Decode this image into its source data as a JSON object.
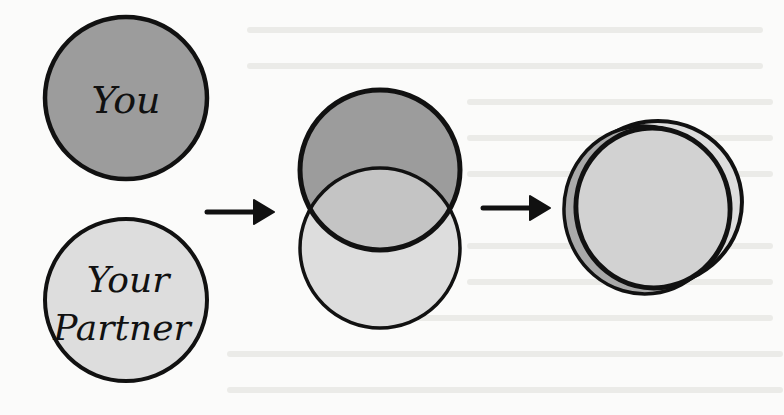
{
  "diagram": {
    "type": "relationship-merge-flow",
    "stages": [
      {
        "id": "separate",
        "circles": [
          {
            "label": "You",
            "fill": "#9c9c9c"
          },
          {
            "label_lines": [
              "Your",
              "Partner"
            ],
            "fill": "#dddddd"
          }
        ]
      },
      {
        "id": "overlapping",
        "circles": [
          {
            "role": "you",
            "fill": "#9c9c9c"
          },
          {
            "role": "partner",
            "fill": "#dddddd"
          }
        ],
        "overlap_fill": "#c4c4c4"
      },
      {
        "id": "merged",
        "circles": [
          {
            "role": "back",
            "fill": "#dddddd"
          },
          {
            "role": "front",
            "fill": "#d2d2d2"
          }
        ],
        "sliver_fill": "#a9a9a9"
      }
    ],
    "arrows": [
      {
        "from": "separate",
        "to": "overlapping"
      },
      {
        "from": "overlapping",
        "to": "merged"
      }
    ],
    "labels": {
      "you": "You",
      "partner_line1": "Your",
      "partner_line2": "Partner"
    },
    "colors": {
      "stroke": "#111111",
      "background": "#fbfbfa",
      "dark_fill": "#9c9c9c",
      "light_fill": "#dddddd",
      "mid_fill": "#c4c4c4"
    }
  }
}
